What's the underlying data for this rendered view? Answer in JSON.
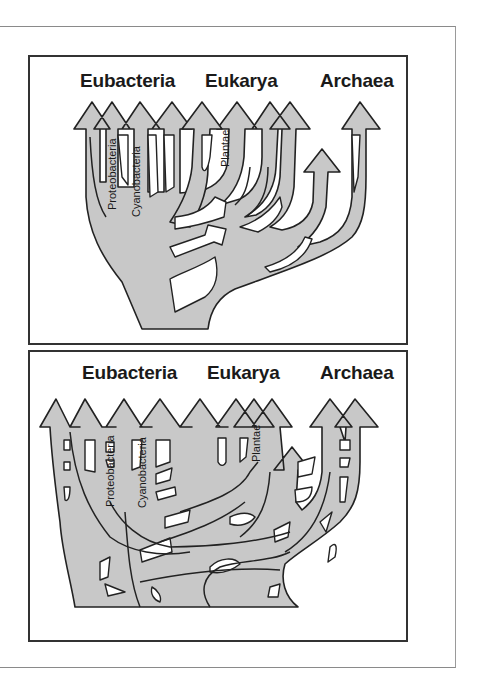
{
  "figure": {
    "panels": [
      {
        "id": "top",
        "description": "Tree of life with limited horizontal gene transfer (endosymbiosis arrows)",
        "domains": [
          "Eubacteria",
          "Eukarya",
          "Archaea"
        ],
        "lineage_labels": [
          "Proteobacteria",
          "Cyanobacteria",
          "Plantae"
        ]
      },
      {
        "id": "bottom",
        "description": "Web-like tree of life with extensive horizontal gene transfer",
        "domains": [
          "Eubacteria",
          "Eukarya",
          "Archaea"
        ],
        "lineage_labels": [
          "Proteobacteria",
          "Cyanobacteria",
          "Plantae"
        ]
      }
    ],
    "colors": {
      "branch_fill": "#c8c8c8",
      "outline": "#222222",
      "background": "#ffffff"
    }
  }
}
